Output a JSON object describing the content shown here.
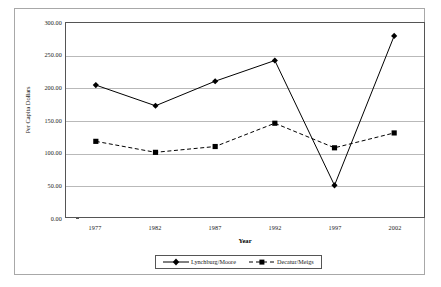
{
  "chart_data": {
    "type": "line",
    "title": "",
    "xlabel": "Year",
    "ylabel": "Per Capita Dollars",
    "categories": [
      "1977",
      "1982",
      "1987",
      "1992",
      "1997",
      "2002"
    ],
    "ylim": [
      0,
      300
    ],
    "ytick_values": [
      0,
      50,
      100,
      150,
      200,
      250,
      300
    ],
    "ytick_labels": [
      "0.00",
      "50.00",
      "100.00",
      "150.00",
      "200.00",
      "250.00",
      "300.00"
    ],
    "grid": true,
    "legend_position": "bottom",
    "series": [
      {
        "name": "Lynchburg/Moore",
        "values": [
          204,
          172,
          210,
          242,
          49,
          280
        ],
        "line_style": "solid",
        "marker": "diamond",
        "color": "#000000"
      },
      {
        "name": "Decatur/Meigs",
        "values": [
          117,
          100,
          109,
          145,
          107,
          130
        ],
        "line_style": "dashed",
        "marker": "square",
        "color": "#000000"
      }
    ]
  },
  "axes": {
    "x_title": "Year",
    "y_title": "Per Capita Dollars"
  },
  "legend": {
    "items": [
      {
        "label": "Lynchburg/Moore"
      },
      {
        "label": "Decatur/Meigs"
      }
    ]
  },
  "colors": {
    "series_line": "#000000",
    "gridline": "#b9b9b9",
    "axis": "#555555",
    "frame": "#a8a8a8",
    "background": "#ffffff"
  }
}
